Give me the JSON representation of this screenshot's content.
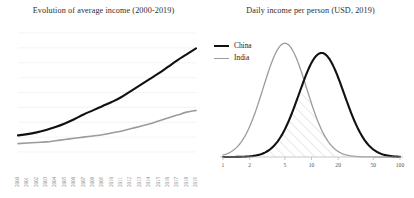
{
  "figure": {
    "background": "#ffffff",
    "panels": 2
  },
  "colors": {
    "china": "#111111",
    "india": "#9b9b9b",
    "gridline": "#efefef",
    "axis": "#b9b9b9",
    "hatch": "#c9c9c9",
    "title_text": "#2e2e2e",
    "tick_text": "#8e8e8e"
  },
  "chart_data": [
    {
      "id": "evolution-of-average-income",
      "type": "line",
      "title": "Evolution of average income (2000-2019)",
      "xlabel": "",
      "ylabel": "",
      "grid": true,
      "grid_axis": "y",
      "legend": "none",
      "categories": [
        "2000",
        "2001",
        "2002",
        "2003",
        "2004",
        "2005",
        "2006",
        "2007",
        "2008",
        "2009",
        "2010",
        "2011",
        "2012",
        "2013",
        "2014",
        "2015",
        "2016",
        "2017",
        "2018",
        "2019"
      ],
      "ylim": [
        0,
        100
      ],
      "series": [
        {
          "name": "China",
          "color": "#111111",
          "width": 2.1,
          "values": [
            14,
            15,
            16.5,
            18.5,
            21,
            24,
            27.5,
            31.5,
            35,
            38.5,
            42,
            46,
            51,
            56,
            61,
            66,
            71.5,
            77,
            82,
            87
          ]
        },
        {
          "name": "India",
          "color": "#9b9b9b",
          "width": 1.6,
          "values": [
            7,
            7.5,
            8,
            8.5,
            9.5,
            10.5,
            11.5,
            12.5,
            13.5,
            14.5,
            16,
            17.5,
            19.5,
            21.5,
            23.5,
            26,
            28.5,
            31,
            33.5,
            35
          ]
        }
      ]
    },
    {
      "id": "daily-income-per-person",
      "type": "area",
      "title": "Daily income per person (USD, 2019)",
      "xlabel": "",
      "ylabel": "",
      "grid": false,
      "xscale": "log",
      "xlim": [
        1,
        100
      ],
      "ylim": [
        0,
        100
      ],
      "xticks": [
        "1",
        "2",
        "5",
        "10",
        "20",
        "50",
        "100"
      ],
      "xtick_values": [
        1,
        2,
        5,
        10,
        20,
        50,
        100
      ],
      "legend": "top-left",
      "overlap_fill": "diagonal-hatch",
      "series": [
        {
          "name": "China",
          "color": "#111111",
          "width": 2.1,
          "peak_x": 13,
          "peak_y": 86,
          "distribution": "lognormal",
          "mu_log10": 1.114,
          "sigma_log10": 0.255
        },
        {
          "name": "India",
          "color": "#9b9b9b",
          "width": 1.3,
          "peak_x": 5,
          "peak_y": 94,
          "distribution": "lognormal",
          "mu_log10": 0.699,
          "sigma_log10": 0.245
        }
      ]
    }
  ],
  "left_panel": {
    "title": "Evolution of average income (2000-2019)",
    "year_labels": [
      "2000",
      "2001",
      "2002",
      "2003",
      "2004",
      "2005",
      "2006",
      "2007",
      "2008",
      "2009",
      "2010",
      "2011",
      "2012",
      "2013",
      "2014",
      "2015",
      "2016",
      "2017",
      "2018",
      "2019"
    ]
  },
  "right_panel": {
    "title": "Daily income per person (USD, 2019)",
    "legend": [
      {
        "label": "China",
        "style": "china"
      },
      {
        "label": "India",
        "style": "india"
      }
    ],
    "tick_labels": [
      "1",
      "2",
      "5",
      "10",
      "20",
      "50",
      "100"
    ]
  }
}
